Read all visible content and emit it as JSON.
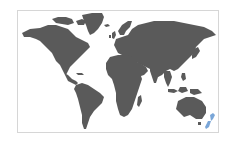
{
  "map": {
    "type": "world-choropleth",
    "land_color": "#5a5a5a",
    "highlight_color": "#7aa6d8",
    "border_color": "#d6d6d6",
    "highlighted_regions": [
      "New Zealand"
    ]
  }
}
